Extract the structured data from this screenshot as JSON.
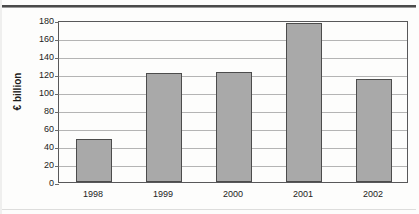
{
  "chart_data": {
    "type": "bar",
    "title": "",
    "subtitle": "",
    "xlabel": "",
    "ylabel": "€ billion",
    "categories": [
      "1998",
      "1999",
      "2000",
      "2001",
      "2002"
    ],
    "values": [
      48,
      121,
      122.5,
      177,
      114
    ],
    "series": [
      {
        "name": "",
        "values": [
          48,
          121,
          122.5,
          177,
          114
        ]
      }
    ],
    "ylim": [
      0,
      180
    ],
    "ytick_step": 20,
    "yticks": [
      "180",
      "160",
      "140",
      "120",
      "100",
      "80",
      "60",
      "40",
      "20",
      "0"
    ],
    "grid": true,
    "grid_axis": "y",
    "legend": false,
    "legend_position": "none",
    "bar_color": "#a9a9a9",
    "bar_border_color": "#4c4c4c",
    "gridline_color": "#b4b4b4",
    "axis_color": "#58585a",
    "annotations": []
  },
  "figure": {
    "watermark_text": "",
    "background_color": "#fdfdfc"
  }
}
